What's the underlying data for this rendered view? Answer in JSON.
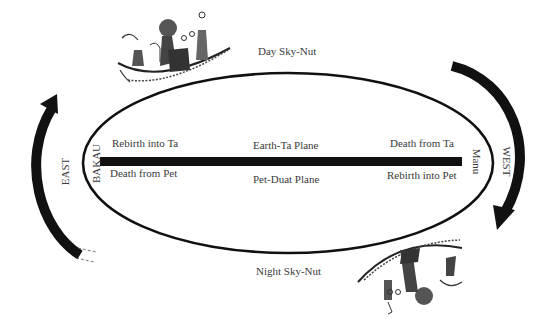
{
  "diagram": {
    "type": "cosmological-cycle",
    "top_label": "Day Sky-Nut",
    "bottom_label": "Night Sky-Nut",
    "planes": {
      "upper": "Earth-Ta Plane",
      "lower": "Pet-Duat Plane"
    },
    "left_side": {
      "horizon": "BAKAU",
      "direction": "EAST",
      "upper_label": "Rebirth into Ta",
      "lower_label": "Death from Pet"
    },
    "right_side": {
      "horizon": "Manu",
      "direction": "WEST",
      "upper_label": "Death from Ta",
      "lower_label": "Rebirth into Pet"
    },
    "icons": {
      "day_boat": "solar-barque-icon",
      "night_boat": "inverted-solar-barque-icon",
      "left_arrow": "curved-arrow-up-icon",
      "right_arrow": "curved-arrow-down-icon"
    },
    "colors": {
      "ink": "#111111",
      "text": "#3a3a3a",
      "figure_fill": "#555555",
      "background": "#ffffff"
    }
  }
}
